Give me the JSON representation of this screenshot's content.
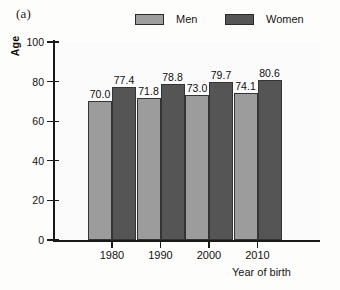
{
  "panel": {
    "label": "(a)"
  },
  "legend": {
    "position": "top-center",
    "entries": [
      {
        "name": "Men",
        "color": "#9c9c9c"
      },
      {
        "name": "Women",
        "color": "#555555"
      }
    ]
  },
  "chart_data": {
    "type": "bar",
    "title": "",
    "subtitle": "",
    "xlabel": "Year of birth",
    "ylabel": "Age",
    "categories": [
      "1980",
      "1990",
      "2000",
      "2010"
    ],
    "series": [
      {
        "name": "Men",
        "color": "#9c9c9c",
        "values": [
          70.0,
          71.8,
          73.0,
          74.1
        ]
      },
      {
        "name": "Women",
        "color": "#555555",
        "values": [
          77.4,
          78.8,
          79.7,
          80.6
        ]
      }
    ],
    "value_labels": [
      [
        "70.0",
        "77.4"
      ],
      [
        "71.8",
        "78.8"
      ],
      [
        "73.0",
        "79.7"
      ],
      [
        "74.1",
        "80.6"
      ]
    ],
    "ylim": [
      0,
      100
    ],
    "yticks": [
      0,
      20,
      40,
      60,
      80,
      100
    ],
    "ytick_labels": [
      "0",
      "20",
      "40",
      "60",
      "80",
      "100"
    ],
    "grid": false,
    "legend_position": "top-center"
  }
}
